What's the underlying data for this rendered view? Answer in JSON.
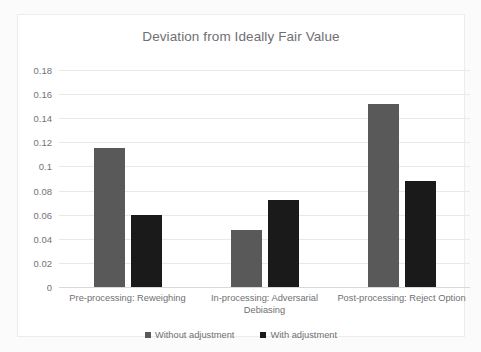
{
  "chart_data": {
    "type": "bar",
    "title": "Deviation from Ideally Fair Value",
    "xlabel": "",
    "ylabel": "",
    "ylim": [
      0,
      0.18
    ],
    "ytick_step": 0.02,
    "yticks": [
      "0.18",
      "0.16",
      "0.14",
      "0.12",
      "0.1",
      "0.08",
      "0.06",
      "0.04",
      "0.02",
      "0"
    ],
    "ytick_values": [
      0.18,
      0.16,
      0.14,
      0.12,
      0.1,
      0.08,
      0.06,
      0.04,
      0.02,
      0
    ],
    "grid": true,
    "legend_position": "bottom",
    "categories": [
      "Pre-processing: Reweighing",
      "In-processing: Adversarial Debiasing",
      "Post-processing: Reject Option"
    ],
    "series": [
      {
        "name": "Without adjustment",
        "color": "#595959",
        "values": [
          0.115,
          0.047,
          0.152
        ]
      },
      {
        "name": "With adjustment",
        "color": "#1a1a1a",
        "values": [
          0.06,
          0.072,
          0.088
        ]
      }
    ]
  }
}
